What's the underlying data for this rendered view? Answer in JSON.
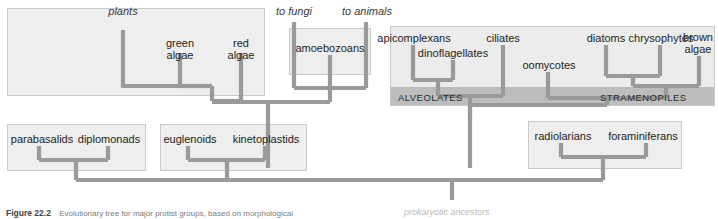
{
  "figure": {
    "number": "Figure 22.2",
    "caption": "Evolutionary tree for major protist groups, based on morphological",
    "root_label": "prokaryotic ancestors"
  },
  "colors": {
    "branch": "#9a9a9a",
    "box_fill": "#ececec",
    "box_border": "#c9c9c9",
    "band_fill": "#bdbdbd",
    "text": "#231f20"
  },
  "external_links": [
    {
      "name": "plants",
      "label": "plants"
    },
    {
      "name": "to-fungi",
      "label": "to fungi"
    },
    {
      "name": "to-animals",
      "label": "to animals"
    }
  ],
  "groups": [
    {
      "key": "plant_clade",
      "band_label": "",
      "taxa": [
        {
          "label": "green algae",
          "lines": [
            "green",
            "algae"
          ]
        },
        {
          "label": "red algae",
          "lines": [
            "red",
            "algae"
          ]
        }
      ]
    },
    {
      "key": "amoebozoa_clade",
      "band_label": "",
      "taxa": [
        {
          "label": "amoebozoans",
          "lines": [
            "amoebozoans"
          ]
        }
      ]
    },
    {
      "key": "alveolates",
      "band_label": "ALVEOLATES",
      "taxa": [
        {
          "label": "apicomplexans",
          "lines": [
            "apicomplexans"
          ]
        },
        {
          "label": "dinoflagellates",
          "lines": [
            "dinoflagellates"
          ]
        },
        {
          "label": "ciliates",
          "lines": [
            "ciliates"
          ]
        }
      ]
    },
    {
      "key": "stramenopiles",
      "band_label": "STRAMENOPILES",
      "taxa": [
        {
          "label": "oomycotes",
          "lines": [
            "oomycotes"
          ]
        },
        {
          "label": "diatoms",
          "lines": [
            "diatoms"
          ]
        },
        {
          "label": "chrysophytes",
          "lines": [
            "chrysophytes"
          ]
        },
        {
          "label": "brown algae",
          "lines": [
            "brown",
            "algae"
          ]
        }
      ]
    },
    {
      "key": "excavates_1",
      "band_label": "",
      "taxa": [
        {
          "label": "parabasalids",
          "lines": [
            "parabasalids"
          ]
        },
        {
          "label": "diplomonads",
          "lines": [
            "diplomonads"
          ]
        }
      ]
    },
    {
      "key": "excavates_2",
      "band_label": "",
      "taxa": [
        {
          "label": "euglenoids",
          "lines": [
            "euglenoids"
          ]
        },
        {
          "label": "kinetoplastids",
          "lines": [
            "kinetoplastids"
          ]
        }
      ]
    },
    {
      "key": "rhizaria",
      "band_label": "",
      "taxa": [
        {
          "label": "radiolarians",
          "lines": [
            "radiolarians"
          ]
        },
        {
          "label": "foraminiferans",
          "lines": [
            "foraminiferans"
          ]
        }
      ]
    }
  ]
}
